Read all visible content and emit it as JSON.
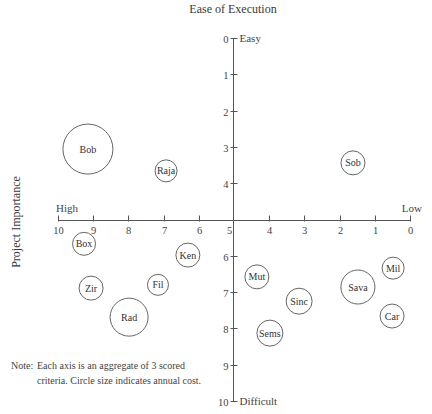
{
  "chart_data": {
    "type": "scatter",
    "subtype": "bubble",
    "title": "Ease of Execution",
    "xlabel": "Project Importance",
    "ylabel": "Ease of Execution",
    "x_axis": {
      "ticks": [
        10,
        9,
        8,
        7,
        6,
        5,
        4,
        3,
        2,
        1,
        0
      ],
      "range": [
        10,
        0
      ],
      "left_label": "High",
      "right_label": "Low"
    },
    "y_axis": {
      "ticks": [
        0,
        1,
        2,
        3,
        4,
        5,
        6,
        7,
        8,
        9,
        10
      ],
      "range": [
        0,
        10
      ],
      "top_label": "Easy",
      "bottom_label": "Difficult",
      "inverted": true
    },
    "grid": false,
    "legend": null,
    "size_meaning": "annual cost",
    "points": [
      {
        "label": "Bob",
        "x": 9.15,
        "y": 3.06,
        "r": 25
      },
      {
        "label": "Raja",
        "x": 6.93,
        "y": 3.66,
        "r": 11
      },
      {
        "label": "Sob",
        "x": 1.62,
        "y": 3.44,
        "r": 12
      },
      {
        "label": "Box",
        "x": 9.26,
        "y": 5.67,
        "r": 11.5
      },
      {
        "label": "Ken",
        "x": 6.31,
        "y": 5.98,
        "r": 12
      },
      {
        "label": "Zir",
        "x": 9.06,
        "y": 6.89,
        "r": 12
      },
      {
        "label": "Fil",
        "x": 7.16,
        "y": 6.8,
        "r": 10.5
      },
      {
        "label": "Rad",
        "x": 7.98,
        "y": 7.69,
        "r": 19
      },
      {
        "label": "Mut",
        "x": 4.35,
        "y": 6.58,
        "r": 12
      },
      {
        "label": "Sinc",
        "x": 3.15,
        "y": 7.25,
        "r": 13
      },
      {
        "label": "Sems",
        "x": 3.98,
        "y": 8.13,
        "r": 13
      },
      {
        "label": "Sava",
        "x": 1.48,
        "y": 6.86,
        "r": 17
      },
      {
        "label": "Mil",
        "x": 0.48,
        "y": 6.34,
        "r": 11
      },
      {
        "label": "Car",
        "x": 0.51,
        "y": 7.66,
        "r": 12
      }
    ]
  },
  "note": {
    "lead": "Note:",
    "line1": "Each axis is an aggregate of 3 scored",
    "line2": "criteria. Circle size indicates annual cost."
  }
}
